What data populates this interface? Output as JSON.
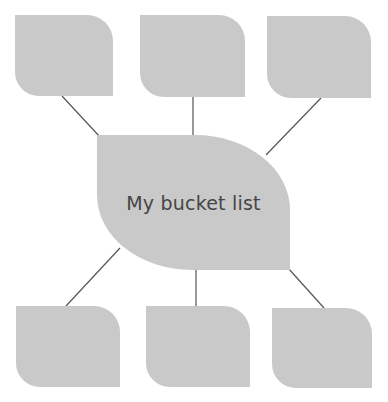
{
  "diagram": {
    "type": "mind-map",
    "center": {
      "label": "My bucket list"
    },
    "branches": [
      {
        "position": "top-left",
        "label": ""
      },
      {
        "position": "top-center",
        "label": ""
      },
      {
        "position": "top-right",
        "label": ""
      },
      {
        "position": "bottom-left",
        "label": ""
      },
      {
        "position": "bottom-center",
        "label": ""
      },
      {
        "position": "bottom-right",
        "label": ""
      }
    ],
    "colors": {
      "node_fill": "#c9c9c9",
      "connector": "#555555",
      "text": "#454545"
    }
  }
}
